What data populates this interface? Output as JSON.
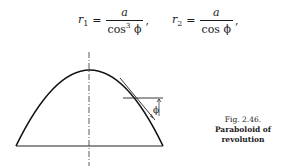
{
  "equations": [
    {
      "lhs_symbol": "r",
      "lhs_sub": "1",
      "equals": "=",
      "numerator": "a",
      "denominator": "cos",
      "denominator_power": "3",
      "denominator_var": " ϕ",
      "punct": ","
    },
    {
      "lhs_symbol": "r",
      "lhs_sub": "2",
      "equals": "=",
      "numerator": "a",
      "denominator": "cos",
      "denominator_power": "",
      "denominator_var": " ϕ",
      "punct": ","
    }
  ],
  "figure": {
    "angle_label": "ϕ",
    "caption_number": "Fig. 2.46.",
    "caption_title": "Paraboloid of revolution"
  }
}
